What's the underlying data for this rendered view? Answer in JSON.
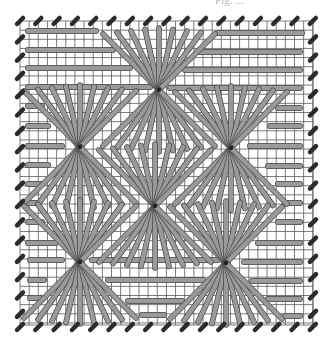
{
  "caption": "Fig. ...",
  "diagram": {
    "type": "needlepoint-stitch-chart",
    "grid": {
      "x0": 20,
      "y0": 21,
      "x1": 313,
      "y1": 325,
      "step": 9.15
    },
    "colors": {
      "grid": "#5a5a5a",
      "thread": "#9a9a9a",
      "thread_outline": "#4a4a4a",
      "hole_mark": "#2b2b2b",
      "background": "#ffffff"
    },
    "edge_marks": {
      "spacing": 18.3,
      "top_y": 21,
      "bottom_y": 327,
      "left_x": 20,
      "right_x": 313
    },
    "stars": [
      {
        "id": "top-center",
        "cx": 159,
        "cy": 90
      },
      {
        "id": "middle-left",
        "cx": 80,
        "cy": 147
      },
      {
        "id": "middle-right",
        "cx": 231,
        "cy": 148
      },
      {
        "id": "center",
        "cx": 155,
        "cy": 206
      },
      {
        "id": "bottom-left",
        "cx": 80,
        "cy": 262
      },
      {
        "id": "bottom-right",
        "cx": 226,
        "cy": 263
      }
    ],
    "horizontal_stitches": [
      {
        "x1": 28,
        "x2": 96,
        "y": 31
      },
      {
        "x1": 218,
        "x2": 302,
        "y": 33
      },
      {
        "x1": 28,
        "x2": 113,
        "y": 50
      },
      {
        "x1": 198,
        "x2": 300,
        "y": 52
      },
      {
        "x1": 28,
        "x2": 130,
        "y": 68
      },
      {
        "x1": 185,
        "x2": 300,
        "y": 70
      },
      {
        "x1": 28,
        "x2": 150,
        "y": 87
      },
      {
        "x1": 170,
        "x2": 300,
        "y": 88
      },
      {
        "x1": 28,
        "x2": 42,
        "y": 106
      },
      {
        "x1": 278,
        "x2": 300,
        "y": 108
      },
      {
        "x1": 28,
        "x2": 48,
        "y": 126
      },
      {
        "x1": 270,
        "x2": 300,
        "y": 126
      },
      {
        "x1": 28,
        "x2": 62,
        "y": 146
      },
      {
        "x1": 250,
        "x2": 300,
        "y": 146
      },
      {
        "x1": 28,
        "x2": 48,
        "y": 165
      },
      {
        "x1": 268,
        "x2": 300,
        "y": 166
      },
      {
        "x1": 28,
        "x2": 42,
        "y": 184
      },
      {
        "x1": 278,
        "x2": 300,
        "y": 184
      },
      {
        "x1": 28,
        "x2": 38,
        "y": 203
      },
      {
        "x1": 285,
        "x2": 300,
        "y": 203
      },
      {
        "x1": 28,
        "x2": 42,
        "y": 222
      },
      {
        "x1": 278,
        "x2": 300,
        "y": 222
      },
      {
        "x1": 28,
        "x2": 56,
        "y": 243
      },
      {
        "x1": 258,
        "x2": 300,
        "y": 243
      },
      {
        "x1": 30,
        "x2": 62,
        "y": 260
      },
      {
        "x1": 92,
        "x2": 218,
        "y": 260
      },
      {
        "x1": 244,
        "x2": 300,
        "y": 262
      },
      {
        "x1": 30,
        "x2": 44,
        "y": 280
      },
      {
        "x1": 108,
        "x2": 203,
        "y": 280
      },
      {
        "x1": 252,
        "x2": 300,
        "y": 281
      },
      {
        "x1": 30,
        "x2": 40,
        "y": 298
      },
      {
        "x1": 128,
        "x2": 182,
        "y": 301
      },
      {
        "x1": 268,
        "x2": 300,
        "y": 299
      },
      {
        "x1": 142,
        "x2": 164,
        "y": 315
      },
      {
        "x1": 285,
        "x2": 300,
        "y": 316
      }
    ]
  }
}
